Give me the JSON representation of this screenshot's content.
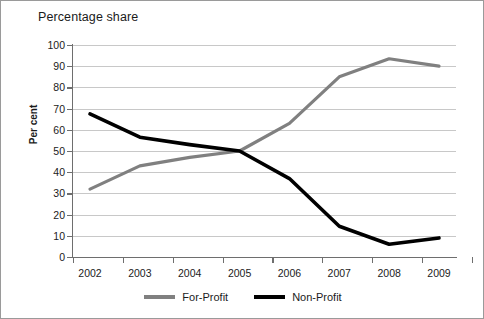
{
  "chart_data": {
    "type": "line",
    "title": "Percentage share",
    "xlabel": "",
    "ylabel": "Per cent",
    "categories": [
      "2002",
      "2003",
      "2004",
      "2005",
      "2006",
      "2007",
      "2008",
      "2009"
    ],
    "ylim": [
      0,
      100
    ],
    "yticks": [
      0,
      10,
      20,
      30,
      40,
      50,
      60,
      70,
      80,
      90,
      100
    ],
    "grid": true,
    "legend_position": "bottom",
    "series": [
      {
        "name": "For-Profit",
        "color": "#808080",
        "values": [
          32,
          43,
          47,
          50,
          63,
          85,
          93.5,
          90
        ]
      },
      {
        "name": "Non-Profit",
        "color": "#000000",
        "values": [
          67.5,
          56.5,
          53,
          50,
          37,
          14.5,
          6,
          9
        ]
      }
    ]
  },
  "legend": [
    {
      "label": "For-Profit",
      "color": "#808080"
    },
    {
      "label": "Non-Profit",
      "color": "#000000"
    }
  ]
}
